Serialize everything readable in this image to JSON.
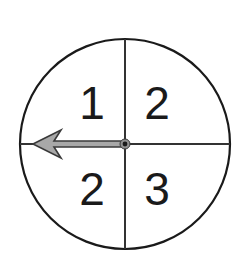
{
  "figure": {
    "type": "spinner-wheel",
    "background_color": "#ffffff",
    "width": 244,
    "height": 261
  },
  "wheel": {
    "center_x": 125,
    "center_y": 144,
    "radius": 105,
    "outline_color": "#1a1a1a",
    "outline_width": 2.2,
    "fill_color": "#ffffff",
    "divider_color": "#333333",
    "divider_width": 2.0,
    "divider_orientation": "cross"
  },
  "sectors": [
    {
      "id": "top-left",
      "label": "1",
      "quadrant": "upper-left",
      "label_x": 92,
      "label_y": 103,
      "font_size": 46
    },
    {
      "id": "top-right",
      "label": "2",
      "quadrant": "upper-right",
      "label_x": 157,
      "label_y": 103,
      "font_size": 46
    },
    {
      "id": "bottom-left",
      "label": "2",
      "quadrant": "lower-left",
      "label_x": 92,
      "label_y": 189,
      "font_size": 46
    },
    {
      "id": "bottom-right",
      "label": "3",
      "quadrant": "lower-right",
      "label_x": 157,
      "label_y": 189,
      "font_size": 46
    }
  ],
  "pointer": {
    "direction": "left",
    "angle_degrees": 180,
    "points_to_sector": "left",
    "tip_x": 33,
    "tail_x": 125,
    "axis_y": 144,
    "shaft_half_height": 3,
    "head_length": 28,
    "head_half_height": 14,
    "head_notch": 7,
    "fill_color": "#a8a8a8",
    "outline_color": "#3a3a3a",
    "outline_width": 1.6
  },
  "pivot": {
    "x": 125,
    "y": 144,
    "outer_radius": 5,
    "inner_radius": 2.4,
    "outer_color": "#8f8f8f",
    "inner_color": "#1a1a1a"
  }
}
